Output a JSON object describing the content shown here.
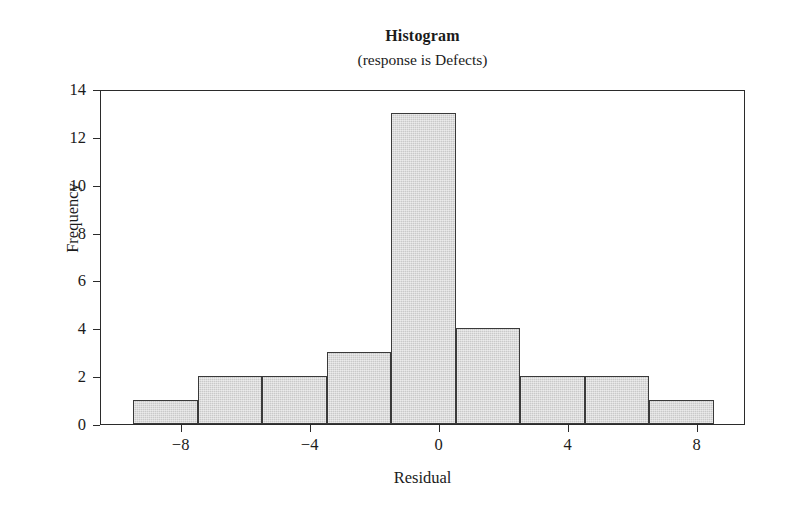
{
  "chart_data": {
    "type": "bar",
    "title": "Histogram",
    "subtitle": "(response is Defects)",
    "xlabel": "Residual",
    "ylabel": "Frequency",
    "grid": false,
    "legend": null,
    "xlim": [
      -10.5,
      9.5
    ],
    "ylim": [
      0,
      14
    ],
    "xticks": [
      -8,
      -4,
      0,
      4,
      8
    ],
    "xtick_labels": [
      "−8",
      "−4",
      "0",
      "4",
      "8"
    ],
    "yticks": [
      0,
      2,
      4,
      6,
      8,
      10,
      12,
      14
    ],
    "ytick_labels": [
      "0",
      "2",
      "4",
      "6",
      "8",
      "10",
      "12",
      "14"
    ],
    "bin_width": 2,
    "bin_edges": [
      -9.5,
      -7.5,
      -5.5,
      -3.5,
      -1.5,
      0.5,
      2.5,
      4.5,
      6.5,
      8.5
    ],
    "bin_centers": [
      -8.5,
      -6.5,
      -4.5,
      -2.5,
      -0.5,
      1.5,
      3.5,
      5.5,
      7.5
    ],
    "values": [
      1,
      2,
      2,
      3,
      13,
      4,
      2,
      2,
      1
    ],
    "bars": [
      {
        "left": -9.5,
        "right": -7.5,
        "frequency": 1
      },
      {
        "left": -7.5,
        "right": -5.5,
        "frequency": 2
      },
      {
        "left": -5.5,
        "right": -3.5,
        "frequency": 2
      },
      {
        "left": -3.5,
        "right": -1.5,
        "frequency": 3
      },
      {
        "left": -1.5,
        "right": 0.5,
        "frequency": 13
      },
      {
        "left": 0.5,
        "right": 2.5,
        "frequency": 4
      },
      {
        "left": 2.5,
        "right": 4.5,
        "frequency": 2
      },
      {
        "left": 4.5,
        "right": 6.5,
        "frequency": 2
      },
      {
        "left": 6.5,
        "right": 8.5,
        "frequency": 1
      }
    ],
    "total_count": 30,
    "colors": {
      "bar_fill": "#cdcdcd",
      "bar_edge": "#3a3a3a",
      "axis": "#2b2b2b",
      "text": "#1b1b1b",
      "background": "#ffffff"
    }
  }
}
